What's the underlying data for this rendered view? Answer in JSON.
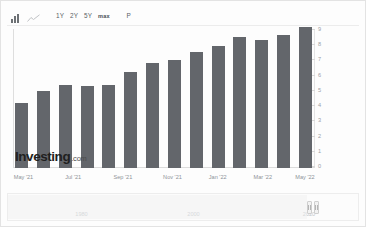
{
  "toolbar": {
    "chart_type_bar_icon": "bar-chart-icon",
    "chart_type_line_icon": "line-chart-icon",
    "periods": [
      {
        "id": "1y",
        "label": "1Y"
      },
      {
        "id": "2y",
        "label": "2Y"
      },
      {
        "id": "5y",
        "label": "5Y"
      },
      {
        "id": "max",
        "label": "max"
      }
    ],
    "p_button_label": "P"
  },
  "watermark": {
    "main": "Investing",
    "suffix": ".com"
  },
  "navigator": {
    "labels": [
      "1980",
      "2000",
      "2020"
    ],
    "label_positions_pct": [
      21,
      53,
      86
    ],
    "handle_left_pct": 85.5,
    "handle_right_pct": 87.5
  },
  "chart_data": {
    "type": "bar",
    "title": "",
    "xlabel": "",
    "ylabel": "",
    "ylim": [
      0,
      9
    ],
    "grid": false,
    "legend": "none",
    "bar_color": "#63666b",
    "categories": [
      "May '21",
      "Jun '21",
      "Jul '21",
      "Aug '21",
      "Sep '21",
      "Oct '21",
      "Nov '21",
      "Dec '21",
      "Jan '22",
      "Feb '22",
      "Mar '22",
      "Apr '22",
      "May '22",
      "Jun '22"
    ],
    "values": [
      4.2,
      5.0,
      5.4,
      5.3,
      5.4,
      6.2,
      6.8,
      7.0,
      7.5,
      7.9,
      8.5,
      8.3,
      8.6,
      9.1
    ],
    "yticks": [
      9,
      8,
      7,
      6,
      5,
      4,
      3,
      2,
      1,
      0
    ],
    "xticks": [
      {
        "label": "May '21",
        "pos_pct": 3.5
      },
      {
        "label": "Jul '21",
        "pos_pct": 20.0
      },
      {
        "label": "Sep '21",
        "pos_pct": 36.5
      },
      {
        "label": "Nov '21",
        "pos_pct": 53.0
      },
      {
        "label": "Jan '22",
        "pos_pct": 68.0
      },
      {
        "label": "Mar '22",
        "pos_pct": 83.0
      },
      {
        "label": "May '22",
        "pos_pct": 97.0
      }
    ]
  }
}
